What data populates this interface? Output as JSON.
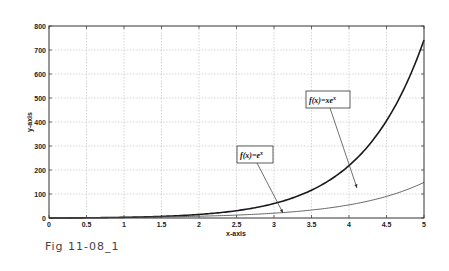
{
  "caption": "Fig 11-08_1",
  "chart_data": {
    "type": "line",
    "title": "",
    "xlabel": "x-axis",
    "ylabel": "y-axis",
    "xlim": [
      0,
      5
    ],
    "ylim": [
      0,
      800
    ],
    "grid": true,
    "x_ticks": [
      "0",
      "0.5",
      "1",
      "1.5",
      "2",
      "2.5",
      "3",
      "3.5",
      "4",
      "4.5",
      "5"
    ],
    "y_ticks": [
      "0",
      "100",
      "200",
      "300",
      "400",
      "500",
      "600",
      "700",
      "800"
    ],
    "series": [
      {
        "name": "f(x)=xe^x",
        "color": "#1a1a1a",
        "line_width": 1.6,
        "x": [
          0,
          0.5,
          1,
          1.5,
          2,
          2.5,
          3,
          3.5,
          4,
          4.5,
          5
        ],
        "values": [
          0,
          0.82,
          2.72,
          6.72,
          14.78,
          30.46,
          60.26,
          115.89,
          218.39,
          405.07,
          742.07
        ]
      },
      {
        "name": "f(x)=e^x",
        "color": "#555555",
        "line_width": 0.9,
        "x": [
          0,
          0.5,
          1,
          1.5,
          2,
          2.5,
          3,
          3.5,
          4,
          4.5,
          5
        ],
        "values": [
          1,
          1.65,
          2.72,
          4.48,
          7.39,
          12.18,
          20.09,
          33.12,
          54.6,
          90.02,
          148.41
        ]
      }
    ],
    "annotations": [
      {
        "label": "f(x)=xe",
        "sup": "x",
        "box": [
          306,
          91,
          44,
          17
        ],
        "arrow_from": [
          330,
          108
        ],
        "arrow_to": [
          357,
          188
        ]
      },
      {
        "label": "f(x)=e",
        "sup": "x",
        "box": [
          237,
          146,
          36,
          17
        ],
        "arrow_from": [
          257,
          163
        ],
        "arrow_to": [
          283,
          213
        ]
      }
    ]
  }
}
